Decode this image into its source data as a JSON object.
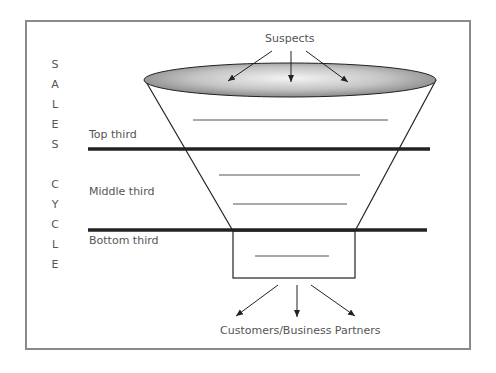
{
  "diagram": {
    "type": "sales funnel",
    "top_label": "Suspects",
    "bottom_label": "Customers/Business Partners",
    "vertical_label": [
      "S",
      "A",
      "L",
      "E",
      "S",
      "",
      "C",
      "Y",
      "C",
      "L",
      "E"
    ],
    "sections": [
      {
        "label": "Top third"
      },
      {
        "label": "Middle third"
      },
      {
        "label": "Bottom third"
      }
    ],
    "colors": {
      "frame": "#8a8a8a",
      "lines": "#222222",
      "ellipse_fill_center": "#f2f2f2",
      "ellipse_fill_edge": "#8c8c8c",
      "text": "#555555"
    }
  }
}
